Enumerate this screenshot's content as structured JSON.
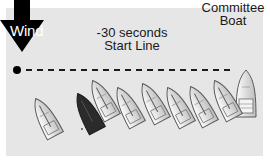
{
  "diagram": {
    "type": "sailing-race-start",
    "background_color": "#e6e6e6",
    "wind": {
      "label": "Wind",
      "direction": "down",
      "color": "#000000"
    },
    "start_line": {
      "label_line1": "-30 seconds",
      "label_line2": "Start Line",
      "style": "dashed"
    },
    "pin_end": {
      "shape": "dot",
      "color": "#000000"
    },
    "committee_boat": {
      "label_line1": "Committee",
      "label_line2": "Boat"
    },
    "boats": [
      {
        "id": 1,
        "x": 46,
        "y": 118,
        "angle": -28,
        "color": "light"
      },
      {
        "id": 2,
        "x": 88,
        "y": 113,
        "angle": -28,
        "color": "dark"
      },
      {
        "id": 3,
        "x": 103,
        "y": 100,
        "angle": -28,
        "color": "light"
      },
      {
        "id": 4,
        "x": 128,
        "y": 107,
        "angle": -28,
        "color": "light"
      },
      {
        "id": 5,
        "x": 153,
        "y": 103,
        "angle": -28,
        "color": "light"
      },
      {
        "id": 6,
        "x": 178,
        "y": 107,
        "angle": -28,
        "color": "light"
      },
      {
        "id": 7,
        "x": 201,
        "y": 106,
        "angle": -28,
        "color": "light"
      },
      {
        "id": 8,
        "x": 225,
        "y": 100,
        "angle": -28,
        "color": "light"
      }
    ],
    "colors": {
      "boat_light_fill": "#f2f2f2",
      "boat_light_stroke": "#5a5a5a",
      "boat_dark_fill": "#2b2b2b",
      "text": "#1a1a1a"
    }
  }
}
